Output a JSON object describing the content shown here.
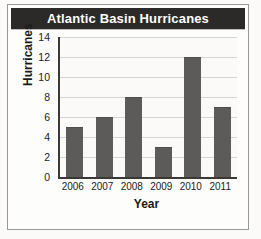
{
  "chart_data": {
    "type": "bar",
    "title": "Atlantic Basin Hurricanes",
    "xlabel": "Year",
    "ylabel": "Hurricanes",
    "categories": [
      "2006",
      "2007",
      "2008",
      "2009",
      "2010",
      "2011"
    ],
    "values": [
      5,
      6,
      8,
      3,
      12,
      7
    ],
    "ylim": [
      0,
      14
    ],
    "ytick_labels": [
      "0",
      "2",
      "4",
      "6",
      "8",
      "10",
      "12",
      "14"
    ],
    "ytick_values": [
      0,
      2,
      4,
      6,
      8,
      10,
      12,
      14
    ],
    "grid": "horizontal",
    "legend": "none",
    "colors": {
      "bar": "#5c5b59",
      "title_bar_background": "#2b2a28",
      "title_text": "#ffffff",
      "axis": "#3a3937",
      "gridline": "#d6d4d1",
      "plot_background": "#fbfaf9",
      "page_background": "#fbfaf8",
      "frame_border": "#9a9893"
    }
  },
  "artifacts": {
    "bleed_text_1": "the maximum money for the",
    "bleed_text_2": "how would I do",
    "bleed_text_3": "by the"
  }
}
